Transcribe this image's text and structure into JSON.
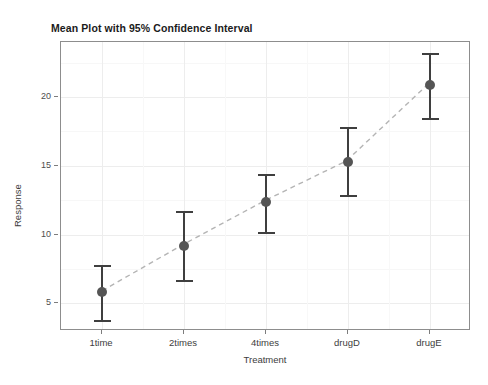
{
  "chart_data": {
    "type": "scatter",
    "title": "Mean Plot with 95% Confidence Interval",
    "xlabel": "Treatment",
    "ylabel": "Response",
    "categories": [
      "1time",
      "2times",
      "4times",
      "drugD",
      "drugE"
    ],
    "values": [
      5.8,
      9.2,
      12.4,
      15.3,
      20.9
    ],
    "error_lower": [
      3.8,
      6.7,
      10.2,
      12.9,
      18.5
    ],
    "error_upper": [
      7.8,
      11.7,
      14.4,
      17.8,
      23.2
    ],
    "series": [
      {
        "name": "Mean",
        "values": [
          5.8,
          9.2,
          12.4,
          15.3,
          20.9
        ]
      }
    ],
    "ylim": [
      3.0,
      24.0
    ],
    "y_ticks": [
      5,
      10,
      15,
      20
    ],
    "y_tick_labels": [
      "5",
      "10",
      "15",
      "20"
    ],
    "y_minor_ticks": [
      7.5,
      12.5,
      17.5,
      22.5
    ],
    "grid": true,
    "legend": false,
    "legend_position": "none",
    "connector": {
      "style": "dashed",
      "color": "#b4b4b4"
    },
    "marker": {
      "shape": "circle",
      "color": "#555555",
      "size": 10
    },
    "errorbar": {
      "color": "#3f3f3f",
      "cap_width": 17,
      "confidence": "95%"
    },
    "panel": {
      "border_color": "#8d8d8d",
      "background": "#ffffff",
      "grid_major_color": "#ededed",
      "grid_minor_color": "#f7f7f7"
    }
  },
  "figure": {
    "background": "#ffffff"
  }
}
